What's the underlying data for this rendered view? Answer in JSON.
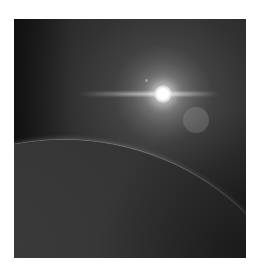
{
  "image": {
    "description": "Grayscale space scene: bright star with horizontal lens-flare streak, secondary flare circle, and the curved horizon of a planet in the lower-left",
    "elements": {
      "star": "bright white sun with glow",
      "lens_streak": "horizontal light streak through the star",
      "flare_circle": "faint gray lens flare disc to lower right of star",
      "small_dot": "tiny flare dot upper-left of star",
      "planet": "dark planet limb arcing from left edge to bottom-right corner"
    },
    "colors": {
      "space": "#262626",
      "glow": "#5c5c5c",
      "star": "#ffffff",
      "planet": "#333333",
      "atmosphere_rim": "#8c8c8c"
    }
  }
}
